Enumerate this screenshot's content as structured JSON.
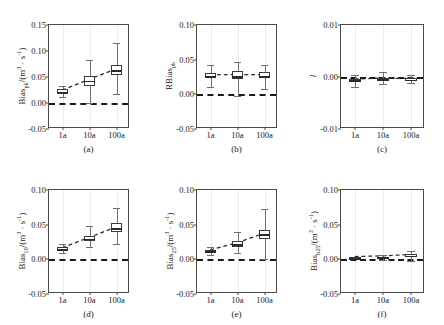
{
  "figure": {
    "cut_header_text": "",
    "panel_order": [
      "a",
      "b",
      "c",
      "d",
      "e",
      "f"
    ]
  },
  "chart_data": [
    {
      "id": "a",
      "type": "box",
      "panel_label": "(a)",
      "ylabel": "Bias_pk/(m^3 · s^-1)",
      "ylabel_parts": {
        "base": "Bias",
        "sub": "pk",
        "unit_pre": "/(m",
        "unit_sup": "3",
        "unit_mid": " · s",
        "unit_sup2": "-1",
        "unit_post": ")"
      },
      "xlabel": "",
      "categories": [
        "1a",
        "10a",
        "100a"
      ],
      "ylim": [
        -0.05,
        0.15
      ],
      "yticks": [
        -0.05,
        0.0,
        0.05,
        0.1,
        0.15
      ],
      "ytick_labels": [
        "-0.05",
        "0.00",
        "0.05",
        "0.10",
        "0.15"
      ],
      "grid": "vertical-light",
      "reference_line": 0.0,
      "trend_values": [
        0.022,
        0.043,
        0.063
      ],
      "boxes": [
        {
          "category": "1a",
          "whisker_low": 0.012,
          "q1": 0.018,
          "median": 0.022,
          "q3": 0.026,
          "whisker_high": 0.032
        },
        {
          "category": "10a",
          "whisker_low": 0.0,
          "q1": 0.033,
          "median": 0.043,
          "q3": 0.051,
          "whisker_high": 0.082
        },
        {
          "category": "100a",
          "whisker_low": 0.018,
          "q1": 0.053,
          "median": 0.063,
          "q3": 0.073,
          "whisker_high": 0.115
        }
      ]
    },
    {
      "id": "b",
      "type": "box",
      "panel_label": "(b)",
      "ylabel": "RBias_pk",
      "ylabel_parts": {
        "base": "RBias",
        "sub": "pk",
        "unit_pre": "",
        "unit_sup": "",
        "unit_mid": "",
        "unit_sup2": "",
        "unit_post": ""
      },
      "xlabel": "",
      "categories": [
        "1a",
        "10a",
        "100a"
      ],
      "ylim": [
        -0.05,
        0.1
      ],
      "yticks": [
        -0.05,
        0.0,
        0.05,
        0.1
      ],
      "ytick_labels": [
        "-0.05",
        "0.00",
        "0.05",
        "0.10"
      ],
      "grid": "vertical-light",
      "reference_line": 0.0,
      "trend_values": [
        0.027,
        0.027,
        0.027
      ],
      "boxes": [
        {
          "category": "1a",
          "whisker_low": 0.01,
          "q1": 0.023,
          "median": 0.026,
          "q3": 0.031,
          "whisker_high": 0.043
        },
        {
          "category": "10a",
          "whisker_low": -0.003,
          "q1": 0.022,
          "median": 0.026,
          "q3": 0.033,
          "whisker_high": 0.047
        },
        {
          "category": "100a",
          "whisker_low": 0.008,
          "q1": 0.023,
          "median": 0.026,
          "q3": 0.032,
          "whisker_high": 0.043
        }
      ]
    },
    {
      "id": "c",
      "type": "box",
      "panel_label": "(c)",
      "ylabel": "l",
      "ylabel_parts": {
        "base": "l",
        "sub": "",
        "unit_pre": "",
        "unit_sup": "",
        "unit_mid": "",
        "unit_sup2": "",
        "unit_post": ""
      },
      "xlabel": "",
      "categories": [
        "1a",
        "10a",
        "100a"
      ],
      "ylim": [
        -0.01,
        0.01
      ],
      "yticks": [
        -0.01,
        0.0,
        0.01
      ],
      "ytick_labels": [
        "-0.01",
        "0.00",
        "0.01"
      ],
      "grid": "vertical-light",
      "reference_line": 0.0,
      "trend_values": [
        -0.0006,
        -0.0004,
        -0.0005
      ],
      "boxes": [
        {
          "category": "1a",
          "whisker_low": -0.002,
          "q1": -0.0009,
          "median": -0.0006,
          "q3": -0.0003,
          "whisker_high": 0.0004
        },
        {
          "category": "10a",
          "whisker_low": -0.0014,
          "q1": -0.0007,
          "median": -0.0004,
          "q3": -0.0001,
          "whisker_high": 0.0009
        },
        {
          "category": "100a",
          "whisker_low": -0.0012,
          "q1": -0.0008,
          "median": -0.0005,
          "q3": -0.0002,
          "whisker_high": 0.0003
        }
      ]
    },
    {
      "id": "d",
      "type": "box",
      "panel_label": "(d)",
      "ylabel": "Bias_10/(m^3 · s^-1)",
      "ylabel_parts": {
        "base": "Bias",
        "sub": "10",
        "unit_pre": "/(m",
        "unit_sup": "3",
        "unit_mid": " · s",
        "unit_sup2": "-1",
        "unit_post": ")"
      },
      "xlabel": "",
      "categories": [
        "1a",
        "10a",
        "100a"
      ],
      "ylim": [
        -0.05,
        0.1
      ],
      "yticks": [
        -0.05,
        0.0,
        0.05,
        0.1
      ],
      "ytick_labels": [
        "-0.05",
        "0.00",
        "0.05",
        "0.10"
      ],
      "grid": "vertical-light",
      "reference_line": 0.0,
      "trend_values": [
        0.015,
        0.03,
        0.045
      ],
      "boxes": [
        {
          "category": "1a",
          "whisker_low": 0.009,
          "q1": 0.013,
          "median": 0.015,
          "q3": 0.018,
          "whisker_high": 0.022
        },
        {
          "category": "10a",
          "whisker_low": 0.018,
          "q1": 0.026,
          "median": 0.03,
          "q3": 0.034,
          "whisker_high": 0.048
        },
        {
          "category": "100a",
          "whisker_low": 0.022,
          "q1": 0.039,
          "median": 0.045,
          "q3": 0.053,
          "whisker_high": 0.074
        }
      ]
    },
    {
      "id": "e",
      "type": "box",
      "panel_label": "(e)",
      "ylabel": "Bias_25/(m^3 · s^-1)",
      "ylabel_parts": {
        "base": "Bias",
        "sub": "25",
        "unit_pre": "/(m",
        "unit_sup": "3",
        "unit_mid": " · s",
        "unit_sup2": "-1",
        "unit_post": ")"
      },
      "xlabel": "",
      "categories": [
        "1a",
        "10a",
        "100a"
      ],
      "ylim": [
        -0.05,
        0.1
      ],
      "yticks": [
        -0.05,
        0.0,
        0.05,
        0.1
      ],
      "ytick_labels": [
        "-0.05",
        "0.00",
        "0.05",
        "0.10"
      ],
      "grid": "vertical-light",
      "reference_line": 0.0,
      "trend_values": [
        0.012,
        0.022,
        0.036
      ],
      "boxes": [
        {
          "category": "1a",
          "whisker_low": 0.006,
          "q1": 0.01,
          "median": 0.012,
          "q3": 0.014,
          "whisker_high": 0.018
        },
        {
          "category": "10a",
          "whisker_low": 0.009,
          "q1": 0.018,
          "median": 0.022,
          "q3": 0.027,
          "whisker_high": 0.04
        },
        {
          "category": "100a",
          "whisker_low": 0.0,
          "q1": 0.03,
          "median": 0.036,
          "q3": 0.043,
          "whisker_high": 0.073
        }
      ]
    },
    {
      "id": "f",
      "type": "box",
      "panel_label": "(f)",
      "ylabel": "Bias_b25/(m^3 · s^-1)",
      "ylabel_parts": {
        "base": "Bias",
        "sub": "b25",
        "unit_pre": "/(m",
        "unit_sup": "3",
        "unit_mid": " · s",
        "unit_sup2": "-1",
        "unit_post": ")"
      },
      "xlabel": "",
      "categories": [
        "1a",
        "10a",
        "100a"
      ],
      "ylim": [
        -0.05,
        0.1
      ],
      "yticks": [
        -0.05,
        0.0,
        0.05,
        0.1
      ],
      "ytick_labels": [
        "-0.05",
        "0.00",
        "0.05",
        "0.10"
      ],
      "grid": "vertical-light",
      "reference_line": 0.0,
      "trend_values": [
        0.002,
        0.003,
        0.005
      ],
      "boxes": [
        {
          "category": "1a",
          "whisker_low": 0.0,
          "q1": 0.001,
          "median": 0.002,
          "q3": 0.003,
          "whisker_high": 0.004
        },
        {
          "category": "10a",
          "whisker_low": -0.001,
          "q1": 0.002,
          "median": 0.003,
          "q3": 0.004,
          "whisker_high": 0.006
        },
        {
          "category": "100a",
          "whisker_low": -0.002,
          "q1": 0.003,
          "median": 0.005,
          "q3": 0.007,
          "whisker_high": 0.012
        }
      ]
    }
  ]
}
